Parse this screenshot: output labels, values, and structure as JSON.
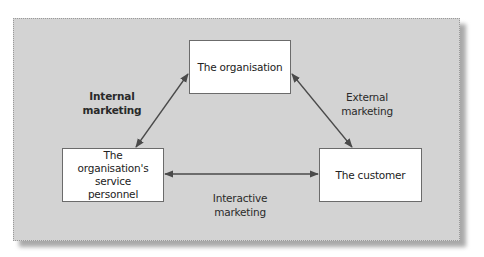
{
  "diagram": {
    "type": "triangle-relationship",
    "background_color": "#d3d3d3",
    "node_fill": "#ffffff",
    "arrow_color": "#4a4a4a",
    "nodes": {
      "organisation": "The organisation",
      "personnel": "The organisation's service personnel",
      "customer": "The customer"
    },
    "edges": {
      "internal": {
        "label": "Internal marketing",
        "from": "organisation",
        "to": "personnel",
        "bidirectional": true
      },
      "external": {
        "label": "External marketing",
        "from": "organisation",
        "to": "customer",
        "bidirectional": true
      },
      "interactive": {
        "label": "Interactive marketing",
        "from": "personnel",
        "to": "customer",
        "bidirectional": true
      }
    }
  }
}
